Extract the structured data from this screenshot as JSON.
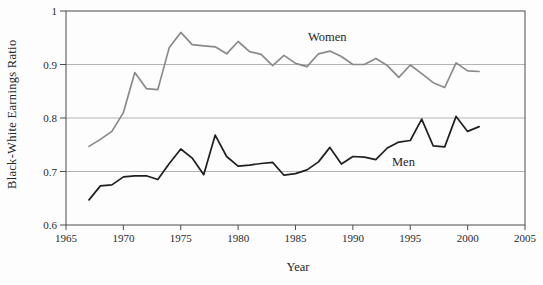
{
  "chart_data": {
    "type": "line",
    "title": "",
    "xlabel": "Year",
    "ylabel": "Black-White Earnings Ratio",
    "xlim": [
      1965,
      2005
    ],
    "ylim": [
      0.6,
      1.0
    ],
    "x_ticks": [
      1965,
      1970,
      1975,
      1980,
      1985,
      1990,
      1995,
      2000,
      2005
    ],
    "y_ticks": [
      0.6,
      0.7,
      0.8,
      0.9,
      1
    ],
    "y_tick_labels": [
      "0.6",
      "0.7",
      "0.8",
      "0.9",
      "1"
    ],
    "grid_values": [
      0.7,
      0.8,
      0.9
    ],
    "grid_on": true,
    "legend_position": "inline-labels",
    "x": [
      1967,
      1968,
      1969,
      1970,
      1971,
      1972,
      1973,
      1974,
      1975,
      1976,
      1977,
      1978,
      1979,
      1980,
      1981,
      1982,
      1983,
      1984,
      1985,
      1986,
      1987,
      1988,
      1989,
      1990,
      1991,
      1992,
      1993,
      1994,
      1995,
      1996,
      1997,
      1998,
      1999,
      2000,
      2001
    ],
    "series": [
      {
        "name": "Women",
        "color": "#8a8a8a",
        "values": [
          0.747,
          0.76,
          0.775,
          0.81,
          0.885,
          0.855,
          0.853,
          0.932,
          0.96,
          0.937,
          0.935,
          0.933,
          0.92,
          0.943,
          0.924,
          0.919,
          0.898,
          0.917,
          0.902,
          0.896,
          0.92,
          0.925,
          0.915,
          0.9,
          0.9,
          0.911,
          0.898,
          0.876,
          0.899,
          0.883,
          0.866,
          0.857,
          0.903,
          0.888,
          0.887
        ]
      },
      {
        "name": "Men",
        "color": "#1f1f1f",
        "values": [
          0.647,
          0.673,
          0.675,
          0.69,
          0.692,
          0.692,
          0.685,
          0.715,
          0.742,
          0.725,
          0.694,
          0.768,
          0.728,
          0.71,
          0.712,
          0.715,
          0.717,
          0.693,
          0.696,
          0.703,
          0.718,
          0.745,
          0.714,
          0.728,
          0.727,
          0.722,
          0.744,
          0.755,
          0.758,
          0.798,
          0.748,
          0.746,
          0.803,
          0.775,
          0.784
        ]
      }
    ]
  },
  "colors": {
    "grid": "#b3b3b3",
    "axis": "#4d4d4d",
    "text": "#2a2a2a",
    "background": "#fdfdfd"
  }
}
